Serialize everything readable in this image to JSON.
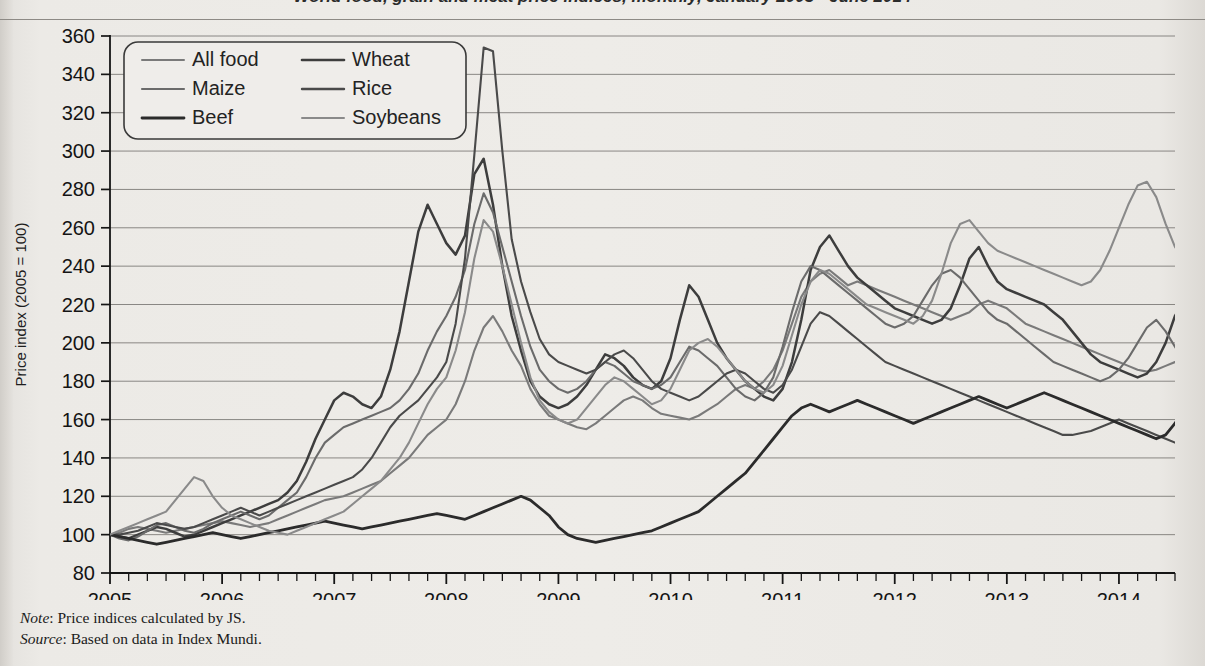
{
  "page": {
    "title_partial": "World food, grain and meat price indices, monthly, January 2005 - June 2014",
    "background_color": "#eceae6",
    "ink_color": "#1c1c1c"
  },
  "note": {
    "note_label": "Note",
    "note_text": ": Price indices calculated by JS.",
    "source_label": "Source",
    "source_text": ": Based on data in Index Mundi."
  },
  "legend": {
    "position": "top-left inside plot",
    "entries": [
      {
        "label": "All food",
        "color": "#7a7a7a",
        "width": 2.0
      },
      {
        "label": "Wheat",
        "color": "#3d3d3d",
        "width": 2.6
      },
      {
        "label": "Maize",
        "color": "#6b6b6b",
        "width": 2.1
      },
      {
        "label": "Rice",
        "color": "#4a4a4a",
        "width": 2.4
      },
      {
        "label": "Beef",
        "color": "#2b2b2b",
        "width": 2.8
      },
      {
        "label": "Soybeans",
        "color": "#8a8a8a",
        "width": 2.0
      }
    ]
  },
  "chart_data": {
    "type": "line",
    "title": "World food, grain and meat price indices, monthly, January 2005 - June 2014",
    "xlabel": "",
    "ylabel": "Price index (2005 = 100)",
    "ylim": [
      80,
      360
    ],
    "ytick_step": 20,
    "yticks": [
      80,
      100,
      120,
      140,
      160,
      180,
      200,
      220,
      240,
      260,
      280,
      300,
      320,
      340,
      360
    ],
    "xlim": [
      2005.0,
      2014.5
    ],
    "xticks": [
      2005,
      2006,
      2007,
      2008,
      2009,
      2010,
      2011,
      2012,
      2013,
      2014
    ],
    "xtick_labels": [
      "2005",
      "2006",
      "2007",
      "2008",
      "2009",
      "2010",
      "2011",
      "2012",
      "2013",
      "2014"
    ],
    "minor_ticks_per_year": 6,
    "grid": "horizontal",
    "legend_position": "upper-left",
    "x_start": 2005.0,
    "x_step": 0.08333,
    "series": [
      {
        "name": "All food",
        "color": "#7a7a7a",
        "values": [
          100,
          101,
          103,
          104,
          103,
          102,
          101,
          102,
          103,
          104,
          105,
          106,
          107,
          106,
          105,
          104,
          105,
          106,
          108,
          110,
          112,
          114,
          116,
          118,
          119,
          120,
          122,
          124,
          126,
          128,
          132,
          136,
          140,
          146,
          152,
          156,
          160,
          168,
          180,
          196,
          208,
          214,
          206,
          196,
          188,
          176,
          168,
          162,
          160,
          158,
          156,
          155,
          158,
          162,
          166,
          170,
          172,
          170,
          166,
          163,
          162,
          161,
          160,
          162,
          165,
          168,
          172,
          176,
          178,
          176,
          180,
          186,
          196,
          210,
          224,
          232,
          236,
          238,
          234,
          230,
          232,
          230,
          228,
          226,
          224,
          222,
          220,
          218,
          216,
          214,
          212,
          214,
          216,
          220,
          222,
          220,
          218,
          214,
          210,
          208,
          206,
          204,
          202,
          200,
          198,
          196,
          194,
          192,
          190,
          188,
          186,
          185,
          186,
          188,
          190,
          192,
          193,
          192
        ]
      },
      {
        "name": "Wheat",
        "color": "#3d3d3d",
        "values": [
          100,
          99,
          98,
          100,
          102,
          104,
          103,
          101,
          99,
          100,
          102,
          104,
          106,
          108,
          110,
          112,
          114,
          116,
          118,
          122,
          128,
          138,
          150,
          160,
          170,
          174,
          172,
          168,
          166,
          172,
          186,
          206,
          232,
          258,
          272,
          262,
          252,
          246,
          256,
          288,
          296,
          272,
          240,
          214,
          196,
          180,
          172,
          168,
          166,
          168,
          172,
          178,
          186,
          194,
          192,
          188,
          182,
          178,
          176,
          180,
          192,
          212,
          230,
          224,
          212,
          200,
          192,
          186,
          180,
          176,
          172,
          170,
          176,
          190,
          212,
          238,
          250,
          256,
          248,
          240,
          234,
          230,
          226,
          222,
          218,
          216,
          214,
          212,
          210,
          212,
          218,
          230,
          244,
          250,
          240,
          232,
          228,
          226,
          224,
          222,
          220,
          216,
          212,
          206,
          200,
          194,
          190,
          188,
          186,
          184,
          182,
          184,
          190,
          200,
          214,
          222,
          218,
          206
        ]
      },
      {
        "name": "Maize",
        "color": "#6b6b6b",
        "values": [
          100,
          98,
          97,
          99,
          102,
          105,
          106,
          104,
          102,
          101,
          103,
          106,
          108,
          110,
          112,
          110,
          108,
          110,
          114,
          118,
          122,
          130,
          140,
          148,
          152,
          156,
          158,
          160,
          162,
          164,
          166,
          170,
          176,
          184,
          196,
          206,
          214,
          224,
          238,
          262,
          278,
          268,
          250,
          232,
          214,
          198,
          186,
          180,
          176,
          174,
          176,
          180,
          186,
          190,
          188,
          184,
          180,
          178,
          176,
          178,
          182,
          190,
          198,
          196,
          192,
          188,
          182,
          176,
          172,
          170,
          174,
          182,
          198,
          216,
          232,
          240,
          238,
          234,
          230,
          226,
          222,
          218,
          214,
          210,
          208,
          210,
          214,
          222,
          230,
          236,
          238,
          234,
          228,
          222,
          216,
          212,
          210,
          206,
          202,
          198,
          194,
          190,
          188,
          186,
          184,
          182,
          180,
          182,
          186,
          192,
          200,
          208,
          212,
          206,
          198,
          190,
          182,
          178
        ]
      },
      {
        "name": "Rice",
        "color": "#4a4a4a",
        "values": [
          100,
          100,
          101,
          102,
          104,
          106,
          105,
          104,
          103,
          104,
          106,
          108,
          110,
          112,
          114,
          112,
          110,
          112,
          114,
          116,
          118,
          120,
          122,
          124,
          126,
          128,
          130,
          134,
          140,
          148,
          156,
          162,
          166,
          170,
          176,
          182,
          190,
          210,
          244,
          298,
          354,
          352,
          300,
          254,
          232,
          216,
          202,
          194,
          190,
          188,
          186,
          184,
          186,
          190,
          194,
          196,
          192,
          186,
          180,
          176,
          174,
          172,
          170,
          172,
          176,
          180,
          184,
          186,
          184,
          180,
          176,
          174,
          178,
          186,
          198,
          210,
          216,
          214,
          210,
          206,
          202,
          198,
          194,
          190,
          188,
          186,
          184,
          182,
          180,
          178,
          176,
          174,
          172,
          170,
          168,
          166,
          164,
          162,
          160,
          158,
          156,
          154,
          152,
          152,
          153,
          154,
          156,
          158,
          160,
          158,
          156,
          154,
          152,
          150,
          148,
          150,
          152,
          153
        ]
      },
      {
        "name": "Beef",
        "color": "#2b2b2b",
        "values": [
          100,
          99,
          98,
          97,
          96,
          95,
          96,
          97,
          98,
          99,
          100,
          101,
          100,
          99,
          98,
          99,
          100,
          101,
          102,
          103,
          104,
          105,
          106,
          107,
          106,
          105,
          104,
          103,
          104,
          105,
          106,
          107,
          108,
          109,
          110,
          111,
          110,
          109,
          108,
          110,
          112,
          114,
          116,
          118,
          120,
          118,
          114,
          110,
          104,
          100,
          98,
          97,
          96,
          97,
          98,
          99,
          100,
          101,
          102,
          104,
          106,
          108,
          110,
          112,
          116,
          120,
          124,
          128,
          132,
          138,
          144,
          150,
          156,
          162,
          166,
          168,
          166,
          164,
          166,
          168,
          170,
          168,
          166,
          164,
          162,
          160,
          158,
          160,
          162,
          164,
          166,
          168,
          170,
          172,
          170,
          168,
          166,
          168,
          170,
          172,
          174,
          172,
          170,
          168,
          166,
          164,
          162,
          160,
          158,
          156,
          154,
          152,
          150,
          152,
          158,
          166,
          174,
          182
        ]
      },
      {
        "name": "Soybeans",
        "color": "#8a8a8a",
        "values": [
          100,
          102,
          104,
          106,
          108,
          110,
          112,
          118,
          124,
          130,
          128,
          120,
          114,
          110,
          108,
          106,
          104,
          102,
          101,
          100,
          102,
          104,
          106,
          108,
          110,
          112,
          116,
          120,
          124,
          128,
          134,
          140,
          148,
          158,
          168,
          176,
          182,
          196,
          216,
          244,
          264,
          258,
          240,
          220,
          200,
          182,
          170,
          164,
          160,
          158,
          160,
          166,
          172,
          178,
          182,
          180,
          176,
          172,
          168,
          170,
          176,
          186,
          196,
          200,
          202,
          198,
          192,
          186,
          180,
          176,
          174,
          178,
          188,
          204,
          220,
          232,
          238,
          236,
          232,
          228,
          224,
          220,
          218,
          216,
          214,
          212,
          210,
          214,
          222,
          236,
          252,
          262,
          264,
          258,
          252,
          248,
          246,
          244,
          242,
          240,
          238,
          236,
          234,
          232,
          230,
          232,
          238,
          248,
          260,
          272,
          282,
          284,
          276,
          262,
          250,
          244,
          242,
          242
        ]
      }
    ]
  }
}
